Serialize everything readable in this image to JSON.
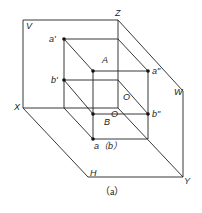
{
  "diagram": {
    "caption": "（a）",
    "colors": {
      "line": "#222222",
      "background": "#ffffff"
    },
    "planes": {
      "V": "V",
      "H": "H",
      "W": "W"
    },
    "axes": {
      "X": "X",
      "Y": "Y",
      "Z": "Z",
      "origin": "O"
    },
    "points": {
      "A": "A",
      "B": "B",
      "a_prime": "a'",
      "b_prime": "b'",
      "a_double_prime": "a\"",
      "b_double_prime": "b\"",
      "ab_horizontal": "a（b）",
      "O_inner": "O"
    }
  }
}
